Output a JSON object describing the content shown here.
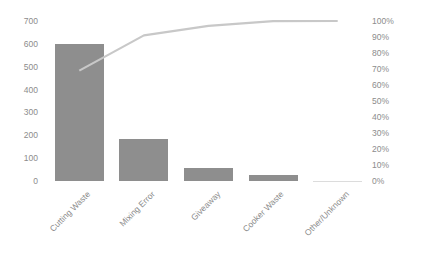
{
  "chart_data": {
    "type": "bar",
    "subtype": "pareto",
    "title": "",
    "xlabel": "",
    "ylabel": "",
    "y2label": "",
    "categories": [
      "Cutting Waste",
      "Mixing Error",
      "Giveaway",
      "Cooker Waste",
      "Other/Unknown"
    ],
    "series": [
      {
        "name": "Count",
        "type": "bar",
        "axis": "left",
        "color": "#8e8e8e",
        "values": [
          600,
          185,
          55,
          25,
          1
        ]
      },
      {
        "name": "Cumulative %",
        "type": "line",
        "axis": "right",
        "color": "#c8c8c8",
        "values": [
          69,
          91,
          97,
          99.9,
          100
        ]
      }
    ],
    "ylim": [
      0,
      700
    ],
    "y_ticks": [
      "0",
      "100",
      "200",
      "300",
      "400",
      "500",
      "600",
      "700"
    ],
    "y2lim": [
      0,
      100
    ],
    "y2_ticks": [
      "0%",
      "10%",
      "20%",
      "30%",
      "40%",
      "50%",
      "60%",
      "70%",
      "80%",
      "90%",
      "100%"
    ],
    "grid": false,
    "legend": "none"
  }
}
